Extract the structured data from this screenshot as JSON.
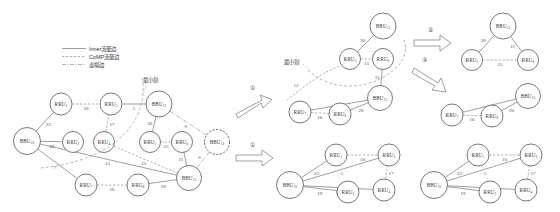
{
  "figure": {
    "legend": {
      "items": [
        {
          "style": "solid",
          "label": "Inner流量边"
        },
        {
          "style": "dashed",
          "label": "CoMP流量边"
        },
        {
          "style": "dash-dot",
          "label": "虚拟边"
        }
      ]
    },
    "cut_label": "最小割",
    "steps": [
      {
        "id": "step-1",
        "label": "①"
      },
      {
        "id": "step-1b",
        "label": "①"
      },
      {
        "id": "step-2",
        "label": "②"
      },
      {
        "id": "step-3",
        "label": "③"
      }
    ],
    "infinity_symbol": "∞"
  },
  "colors": {
    "background": "#ffffff",
    "node_stroke": "#555555",
    "edge_solid": "#6a6a6a",
    "edge_dashed": "#8a8a8a",
    "cut": "#9a9a9a",
    "text": "#333333"
  },
  "graphs": {
    "main": {
      "name": "main-graph",
      "nodes": [
        {
          "id": "bbu10",
          "base": "BBU",
          "sub": "10",
          "x": 27,
          "y": 141,
          "r": 13.5,
          "dashed": false
        },
        {
          "id": "rru1",
          "base": "RRU",
          "sub": "1",
          "x": 61,
          "y": 104,
          "r": 11,
          "dashed": false
        },
        {
          "id": "rru2",
          "base": "RRU",
          "sub": "2",
          "x": 73,
          "y": 142,
          "r": 10.5,
          "dashed": false
        },
        {
          "id": "rru3",
          "base": "RRU",
          "sub": "3",
          "x": 111,
          "y": 104,
          "r": 11,
          "dashed": false
        },
        {
          "id": "rru4",
          "base": "RRU",
          "sub": "4",
          "x": 104,
          "y": 142,
          "r": 10.5,
          "dashed": false
        },
        {
          "id": "bbu11",
          "base": "BBU",
          "sub": "11",
          "x": 159,
          "y": 104,
          "r": 13,
          "dashed": false
        },
        {
          "id": "rru5",
          "base": "RRU",
          "sub": "5",
          "x": 150,
          "y": 142,
          "r": 10.5,
          "dashed": false
        },
        {
          "id": "rru6",
          "base": "RRU",
          "sub": "6",
          "x": 182,
          "y": 142,
          "r": 10.5,
          "dashed": false
        },
        {
          "id": "bbu12",
          "base": "BBU",
          "sub": "12",
          "x": 217,
          "y": 142,
          "r": 12.5,
          "dashed": true
        },
        {
          "id": "rru7",
          "base": "RRU",
          "sub": "7",
          "x": 86,
          "y": 185,
          "r": 11,
          "dashed": false
        },
        {
          "id": "rru8",
          "base": "RRU",
          "sub": "8",
          "x": 138,
          "y": 185,
          "r": 11,
          "dashed": false
        },
        {
          "id": "bbu13",
          "base": "BBU",
          "sub": "13",
          "x": 189,
          "y": 178,
          "r": 12.5,
          "dashed": false
        }
      ],
      "edges": [
        {
          "from": "bbu10",
          "to": "rru1",
          "w": "23",
          "style": "solid"
        },
        {
          "from": "rru1",
          "to": "rru3",
          "w": "10",
          "style": "dashed"
        },
        {
          "from": "bbu10",
          "to": "rru2",
          "w": "19",
          "style": "solid"
        },
        {
          "from": "rru3",
          "to": "bbu11",
          "w": "5",
          "style": "solid"
        },
        {
          "from": "rru4",
          "to": "rru3",
          "w": "17",
          "style": "dashed"
        },
        {
          "from": "bbu11",
          "to": "rru5",
          "w": "30",
          "style": "solid"
        },
        {
          "from": "rru5",
          "to": "rru6",
          "w": "15",
          "style": "dashed"
        },
        {
          "from": "bbu11",
          "to": "bbu12",
          "w": "∞",
          "style": "dash-dot"
        },
        {
          "from": "rru6",
          "to": "bbu13",
          "w": "11",
          "style": "solid"
        },
        {
          "from": "bbu12",
          "to": "bbu13",
          "w": "∞",
          "style": "dash-dot"
        },
        {
          "from": "bbu10",
          "to": "rru7",
          "w": "7",
          "style": "solid"
        },
        {
          "from": "rru7",
          "to": "rru8",
          "w": "16",
          "style": "dashed"
        },
        {
          "from": "rru8",
          "to": "bbu13",
          "w": "20",
          "style": "solid"
        },
        {
          "from": "rru4",
          "to": "bbu13",
          "w": "12",
          "style": "dashed"
        },
        {
          "from": "bbu10",
          "to": "bbu13",
          "w": "12",
          "style": "solid"
        }
      ]
    },
    "mid_upper": {
      "name": "subgraph-mid-upper",
      "nodes": [
        {
          "id": "bbu11",
          "base": "BBU",
          "sub": "11",
          "x": 383,
          "y": 26,
          "r": 13,
          "dashed": false
        },
        {
          "id": "rru5",
          "base": "RRU",
          "sub": "5",
          "x": 350,
          "y": 59,
          "r": 10.5,
          "dashed": false
        },
        {
          "id": "rru6",
          "base": "RRU",
          "sub": "6",
          "x": 383,
          "y": 59,
          "r": 10.5,
          "dashed": false
        },
        {
          "id": "bbu13",
          "base": "BBU",
          "sub": "13",
          "x": 380,
          "y": 98,
          "r": 12.5,
          "dashed": false
        },
        {
          "id": "rru7",
          "base": "RRU",
          "sub": "7",
          "x": 300,
          "y": 112,
          "r": 11,
          "dashed": false
        },
        {
          "id": "rru8",
          "base": "RRU",
          "sub": "8",
          "x": 340,
          "y": 114,
          "r": 11,
          "dashed": false
        }
      ],
      "edges": [
        {
          "from": "bbu11",
          "to": "rru5",
          "w": "30",
          "style": "solid"
        },
        {
          "from": "rru5",
          "to": "rru6",
          "w": "15",
          "style": "dashed"
        },
        {
          "from": "rru6",
          "to": "bbu13",
          "w": "11",
          "style": "solid"
        },
        {
          "from": "rru7",
          "to": "bbu13",
          "w": "7",
          "style": "solid"
        },
        {
          "from": "rru7",
          "to": "rru8",
          "w": "16",
          "style": "dashed"
        },
        {
          "from": "rru8",
          "to": "bbu13",
          "w": "20",
          "style": "solid"
        }
      ],
      "cut_label": "最小割",
      "extra_weights": [
        {
          "w": "12",
          "x": 296,
          "y": 85
        }
      ]
    },
    "top_right": {
      "name": "subgraph-top-right",
      "nodes": [
        {
          "id": "bbu11",
          "base": "BBU",
          "sub": "11",
          "x": 503,
          "y": 26,
          "r": 13,
          "dashed": false
        },
        {
          "id": "rru5",
          "base": "RRU",
          "sub": "5",
          "x": 472,
          "y": 60,
          "r": 10.5,
          "dashed": false
        },
        {
          "id": "rru6",
          "base": "RRU",
          "sub": "6",
          "x": 528,
          "y": 60,
          "r": 10.5,
          "dashed": false
        }
      ],
      "edges": [
        {
          "from": "bbu11",
          "to": "rru5",
          "w": "30",
          "style": "solid"
        },
        {
          "from": "bbu11",
          "to": "rru6",
          "w": "11",
          "style": "solid"
        },
        {
          "from": "rru5",
          "to": "rru6",
          "w": "15",
          "style": "dashed"
        }
      ]
    },
    "mid_right": {
      "name": "subgraph-mid-right",
      "nodes": [
        {
          "id": "bbu13",
          "base": "BBU",
          "sub": "13",
          "x": 528,
          "y": 96,
          "r": 12.5,
          "dashed": false
        },
        {
          "id": "rru7",
          "base": "RRU",
          "sub": "7",
          "x": 452,
          "y": 115,
          "r": 11,
          "dashed": false
        },
        {
          "id": "rru8",
          "base": "RRU",
          "sub": "8",
          "x": 492,
          "y": 116,
          "r": 11,
          "dashed": false
        }
      ],
      "edges": [
        {
          "from": "rru7",
          "to": "bbu13",
          "w": "7",
          "style": "solid"
        },
        {
          "from": "rru7",
          "to": "rru8",
          "w": "16",
          "style": "dashed"
        },
        {
          "from": "rru8",
          "to": "bbu13",
          "w": "20",
          "style": "solid"
        }
      ]
    },
    "bottom_mid": {
      "name": "subgraph-bottom-mid",
      "nodes": [
        {
          "id": "bbu10",
          "base": "BBU",
          "sub": "10",
          "x": 290,
          "y": 185,
          "r": 13.5,
          "dashed": false
        },
        {
          "id": "rru1",
          "base": "RRU",
          "sub": "1",
          "x": 336,
          "y": 155,
          "r": 11,
          "dashed": false
        },
        {
          "id": "rru3",
          "base": "RRU",
          "sub": "3",
          "x": 389,
          "y": 155,
          "r": 11,
          "dashed": false
        },
        {
          "id": "rru2",
          "base": "RRU",
          "sub": "2",
          "x": 348,
          "y": 192,
          "r": 11,
          "dashed": false
        },
        {
          "id": "rru4",
          "base": "RRU",
          "sub": "4",
          "x": 384,
          "y": 190,
          "r": 11,
          "dashed": false
        }
      ],
      "edges": [
        {
          "from": "bbu10",
          "to": "rru1",
          "w": "23",
          "style": "solid"
        },
        {
          "from": "rru1",
          "to": "rru3",
          "w": "10",
          "style": "dashed"
        },
        {
          "from": "bbu10",
          "to": "rru3",
          "w": "5",
          "style": "solid"
        },
        {
          "from": "bbu10",
          "to": "rru4",
          "w": "12",
          "style": "solid"
        },
        {
          "from": "bbu10",
          "to": "rru2",
          "w": "19",
          "style": "solid"
        },
        {
          "from": "rru4",
          "to": "rru3",
          "w": "17",
          "style": "dashed"
        }
      ]
    },
    "bottom_right": {
      "name": "subgraph-bottom-right",
      "nodes": [
        {
          "id": "bbu10",
          "base": "BBU",
          "sub": "10",
          "x": 434,
          "y": 185,
          "r": 13.5,
          "dashed": false
        },
        {
          "id": "rru1",
          "base": "RRU",
          "sub": "1",
          "x": 478,
          "y": 155,
          "r": 11,
          "dashed": false
        },
        {
          "id": "rru3",
          "base": "RRU",
          "sub": "3",
          "x": 531,
          "y": 155,
          "r": 11,
          "dashed": false
        },
        {
          "id": "rru2",
          "base": "RRU",
          "sub": "2",
          "x": 490,
          "y": 192,
          "r": 11,
          "dashed": false
        },
        {
          "id": "rru4",
          "base": "RRU",
          "sub": "4",
          "x": 526,
          "y": 190,
          "r": 11,
          "dashed": false
        }
      ],
      "edges": [
        {
          "from": "bbu10",
          "to": "rru1",
          "w": "23",
          "style": "solid"
        },
        {
          "from": "rru1",
          "to": "rru3",
          "w": "10",
          "style": "dashed"
        },
        {
          "from": "bbu10",
          "to": "rru3",
          "w": "5",
          "style": "solid"
        },
        {
          "from": "bbu10",
          "to": "rru4",
          "w": "12",
          "style": "solid"
        },
        {
          "from": "bbu10",
          "to": "rru2",
          "w": "19",
          "style": "solid"
        },
        {
          "from": "rru4",
          "to": "rru3",
          "w": "17",
          "style": "dashed"
        }
      ]
    }
  }
}
